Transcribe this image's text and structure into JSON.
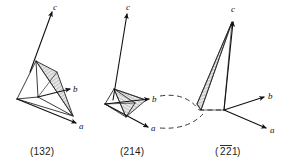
{
  "figure": {
    "background_color": "#ffffff",
    "line_color": "#1a1a1a",
    "hatch_color": "#808080",
    "panels": [
      {
        "id": "panel-132",
        "caption": "(132)",
        "miller_indices": [
          1,
          3,
          2
        ],
        "negative_indices": [],
        "axes": [
          {
            "name": "c-axis",
            "label": "c"
          },
          {
            "name": "b-axis",
            "label": "b"
          },
          {
            "name": "a-axis",
            "label": "a"
          }
        ]
      },
      {
        "id": "panel-214",
        "caption": "(214)",
        "miller_indices": [
          2,
          1,
          4
        ],
        "negative_indices": [],
        "axes": [
          {
            "name": "c-axis",
            "label": "c"
          },
          {
            "name": "b-axis",
            "label": "b"
          },
          {
            "name": "a-axis",
            "label": "a"
          }
        ]
      },
      {
        "id": "panel-221bar",
        "caption": "(221)",
        "caption_prefix": "(",
        "caption_suffix": ")",
        "caption_digits": [
          "2",
          "2",
          "1"
        ],
        "miller_indices": [
          -2,
          -2,
          1
        ],
        "negative_indices": [
          0,
          1
        ],
        "axes": [
          {
            "name": "c-axis",
            "label": "c"
          },
          {
            "name": "b-axis",
            "label": "b"
          },
          {
            "name": "a-axis",
            "label": "a"
          }
        ]
      }
    ]
  }
}
